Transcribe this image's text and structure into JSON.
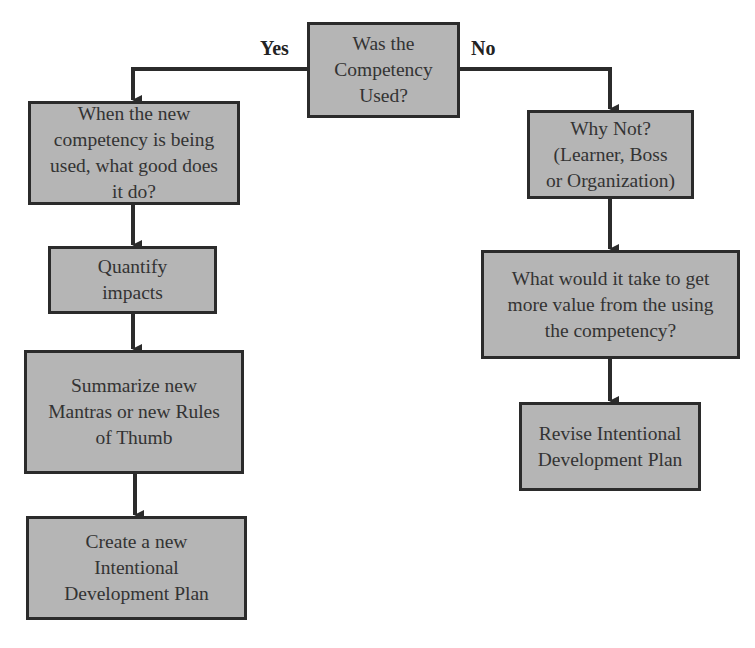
{
  "diagram": {
    "type": "flowchart",
    "colors": {
      "box_fill": "#b5b5b5",
      "border": "#2b2b2b",
      "text": "#333333",
      "line": "#2b2b2b"
    },
    "decision": {
      "id": "was-used",
      "text": "Was the\nCompetency\nUsed?"
    },
    "branch_labels": {
      "yes": "Yes",
      "no": "No"
    },
    "yes_branch": [
      {
        "id": "good",
        "text": "When the new\ncompetency is being\nused, what good does\nit do?"
      },
      {
        "id": "quantify",
        "text": "Quantify\nimpacts"
      },
      {
        "id": "summarize",
        "text": "Summarize new\nMantras or new Rules\nof Thumb"
      },
      {
        "id": "create-plan",
        "text": "Create a new\nIntentional\nDevelopment Plan"
      }
    ],
    "no_branch": [
      {
        "id": "why-not",
        "text": "Why Not?\n(Learner, Boss\nor Organization)"
      },
      {
        "id": "more-value",
        "text": "What would it take to get\nmore value from the using\nthe competency?"
      },
      {
        "id": "revise-plan",
        "text": "Revise Intentional\nDevelopment Plan"
      }
    ],
    "edges": [
      {
        "from": "was-used",
        "to": "good",
        "label": "Yes"
      },
      {
        "from": "was-used",
        "to": "why-not",
        "label": "No"
      },
      {
        "from": "good",
        "to": "quantify"
      },
      {
        "from": "quantify",
        "to": "summarize"
      },
      {
        "from": "summarize",
        "to": "create-plan"
      },
      {
        "from": "why-not",
        "to": "more-value"
      },
      {
        "from": "more-value",
        "to": "revise-plan"
      }
    ]
  }
}
